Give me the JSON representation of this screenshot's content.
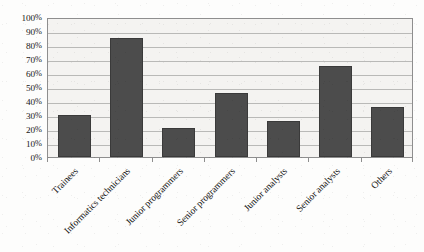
{
  "chart_data": {
    "type": "bar",
    "title": "",
    "subtitle": "",
    "xlabel": "",
    "ylabel": "",
    "categories": [
      "Trainees",
      "Informatics technicians",
      "Junior programmers",
      "Senior programmers",
      "Junior analysts",
      "Senior analysts",
      "Others"
    ],
    "values": [
      30,
      85,
      21,
      46,
      26,
      65,
      36
    ],
    "ylim": [
      0,
      100
    ],
    "ytick_values": [
      0,
      10,
      20,
      30,
      40,
      50,
      60,
      70,
      80,
      90,
      100
    ],
    "ytick_labels": [
      "0%",
      "10%",
      "20%",
      "30%",
      "40%",
      "50%",
      "60%",
      "70%",
      "80%",
      "90%",
      "100%"
    ],
    "ytick_suffix": "%",
    "grid": true,
    "grid_axis": "y",
    "legend": false,
    "legend_position": "none",
    "series": [
      {
        "name": "Percentage",
        "values": [
          30,
          85,
          21,
          46,
          26,
          65,
          36
        ]
      }
    ],
    "colors": {
      "bar_fill": "#4c4c4c",
      "bar_edge": "#3a3a3a",
      "plot_background": "#f4f3f1",
      "gridline": "#b9b9b7",
      "axis_line": "#8e8e8e",
      "text": "#131313",
      "page_background": "#fdfdfc"
    },
    "x_label_rotation_degrees": -45
  }
}
